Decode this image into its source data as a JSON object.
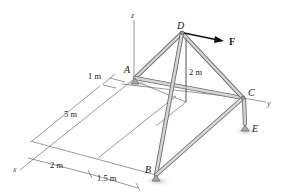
{
  "figure": {
    "points": {
      "A": "A",
      "B": "B",
      "C": "C",
      "D": "D",
      "E": "E"
    },
    "axes": {
      "x": "x",
      "y": "y",
      "z": "z"
    },
    "force": {
      "label": "F"
    },
    "dimensions": {
      "height_AD": "2 m",
      "offset_1": "1 m",
      "length_x": "5 m",
      "width_1": "2 m",
      "width_2": "1.5 m"
    },
    "colors": {
      "member_fill": "#d6d6d6",
      "member_outline": "#6f6f6f",
      "shadow": "#c9c9c9",
      "arrow": "#111111"
    }
  }
}
